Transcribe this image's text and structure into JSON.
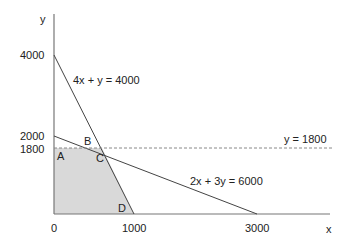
{
  "diagram": {
    "axes": {
      "x_label": "x",
      "y_label": "y",
      "x_ticks": [
        "0",
        "1000",
        "3000"
      ],
      "y_ticks": [
        "4000",
        "2000",
        "1800"
      ]
    },
    "lines": [
      {
        "label": "4x + y = 4000"
      },
      {
        "label": "2x + 3y = 6000"
      },
      {
        "label": "y = 1800",
        "style": "dashed"
      }
    ],
    "points": [
      "A",
      "B",
      "C",
      "D"
    ],
    "colors": {
      "shading": "#d9d9d9",
      "line": "#555555",
      "axis": "#777777"
    }
  }
}
